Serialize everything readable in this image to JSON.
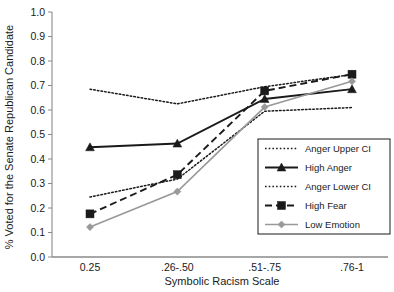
{
  "chart_data": {
    "type": "line",
    "title": "",
    "xlabel": "Symbolic Racism Scale",
    "ylabel": "% Voted for the Senate Republican Candidate",
    "categories": [
      "0.25",
      ".26-.50",
      ".51-.75",
      ".76-1"
    ],
    "ylim": [
      0.0,
      1.0
    ],
    "ytick_labels": [
      "0.0",
      "0.1",
      "0.2",
      "0.3",
      "0.4",
      "0.5",
      "0.6",
      "0.7",
      "0.8",
      "0.9",
      "1.0"
    ],
    "ytick_values": [
      0.0,
      0.1,
      0.2,
      0.3,
      0.4,
      0.5,
      0.6,
      0.7,
      0.8,
      0.9,
      1.0
    ],
    "grid": false,
    "legend_position": "lower right",
    "series": [
      {
        "name": "Anger Upper CI",
        "values": [
          0.685,
          0.625,
          0.695,
          0.745
        ],
        "style": "dotted",
        "marker": "none",
        "color": "#1a1a1a"
      },
      {
        "name": "High Anger",
        "values": [
          0.448,
          0.463,
          0.645,
          0.685
        ],
        "style": "solid",
        "marker": "triangle",
        "color": "#1a1a1a"
      },
      {
        "name": "Anger Lower CI",
        "values": [
          0.245,
          0.318,
          0.595,
          0.61
        ],
        "style": "dotted",
        "marker": "none",
        "color": "#1a1a1a"
      },
      {
        "name": "High Fear",
        "values": [
          0.176,
          0.336,
          0.678,
          0.746
        ],
        "style": "dashed",
        "marker": "square",
        "color": "#1a1a1a"
      },
      {
        "name": "Low Emotion",
        "values": [
          0.122,
          0.267,
          0.612,
          0.717
        ],
        "style": "solid",
        "marker": "diamond",
        "color": "#999999"
      }
    ]
  },
  "legend": {
    "items": [
      {
        "label": "Anger Upper CI"
      },
      {
        "label": "High Anger"
      },
      {
        "label": "Anger Lower CI"
      },
      {
        "label": "High Fear"
      },
      {
        "label": "Low Emotion"
      }
    ]
  }
}
